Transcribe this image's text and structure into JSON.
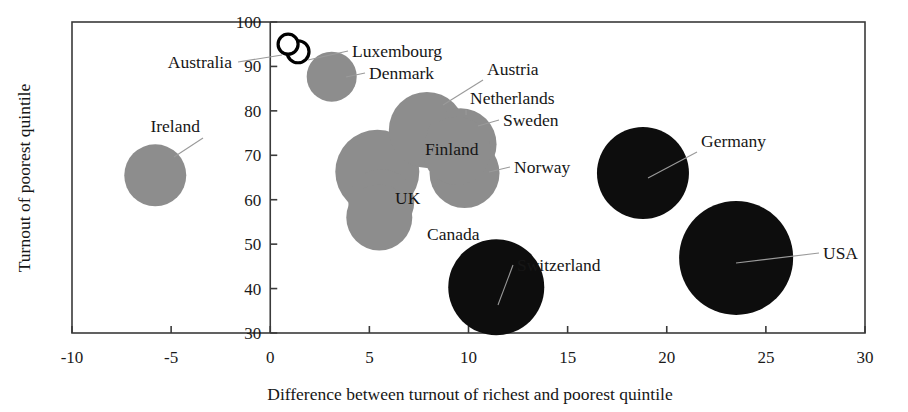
{
  "chart_data": {
    "type": "scatter",
    "title": "",
    "xlabel": "Difference between turnout of richest and poorest quintile",
    "ylabel": "Turnout of poorest quintile",
    "xlim": [
      -10,
      30
    ],
    "ylim": [
      30,
      100
    ],
    "xticks": [
      -10,
      -5,
      0,
      5,
      10,
      15,
      20,
      25,
      30
    ],
    "yticks": [
      30,
      40,
      50,
      60,
      70,
      80,
      90,
      100
    ],
    "xticklabels": [
      "-10",
      "-5",
      "0",
      "5",
      "10",
      "15",
      "20",
      "25",
      "30"
    ],
    "yticklabels": [
      "30",
      "40",
      "50",
      "60",
      "70",
      "80",
      "90",
      "100"
    ],
    "grid": false,
    "legend": false,
    "size_encodes": "bubble area",
    "marker_styles": {
      "grey": "filled grey disc",
      "black": "filled black disc",
      "open": "white disc with black outline"
    },
    "points": [
      {
        "label": "Ireland",
        "x": -5.8,
        "y": 65.5,
        "r_px": 31,
        "style": "grey",
        "label_x": 200,
        "label_y": 132,
        "label_anchor": "end",
        "leader": [
          203,
          138,
          174,
          157
        ]
      },
      {
        "label": "Australia",
        "x": 0.9,
        "y": 95.0,
        "r_px": 10,
        "style": "open",
        "label_x": 232,
        "label_y": 68,
        "label_anchor": "end",
        "leader": [
          238,
          62,
          282,
          55
        ]
      },
      {
        "label": "Luxembourg",
        "x": 1.4,
        "y": 93.3,
        "r_px": 11,
        "style": "open",
        "label_x": 352,
        "label_y": 57,
        "label_anchor": "start",
        "leader": [
          348,
          51,
          308,
          60
        ]
      },
      {
        "label": "Denmark",
        "x": 3.1,
        "y": 87.7,
        "r_px": 25,
        "style": "grey",
        "label_x": 369,
        "label_y": 79,
        "label_anchor": "start",
        "leader": [
          365,
          73,
          346,
          77
        ]
      },
      {
        "label": "Austria",
        "x": 7.9,
        "y": 75.7,
        "r_px": 38,
        "style": "grey",
        "label_x": 487,
        "label_y": 75,
        "label_anchor": "start",
        "leader": [
          483,
          80,
          443,
          105
        ]
      },
      {
        "label": "Netherlands",
        "x": 9.6,
        "y": 72.5,
        "r_px": 36,
        "style": "grey",
        "label_x": 470,
        "label_y": 104,
        "label_anchor": "start",
        "leader": [
          466,
          110,
          466,
          115
        ]
      },
      {
        "label": "Sweden",
        "x": 9.4,
        "y": 71.0,
        "r_px": 34,
        "style": "grey",
        "label_x": 503,
        "label_y": 126,
        "label_anchor": "start",
        "leader": [
          499,
          120,
          478,
          126
        ]
      },
      {
        "label": "Finland",
        "x": 5.4,
        "y": 66.3,
        "r_px": 42,
        "style": "grey",
        "label_x": 425,
        "label_y": 155,
        "label_anchor": "start",
        "leader": [
          null,
          null,
          null,
          null
        ]
      },
      {
        "label": "Norway",
        "x": 9.8,
        "y": 66.0,
        "r_px": 35,
        "style": "grey",
        "label_x": 514,
        "label_y": 173,
        "label_anchor": "start",
        "leader": [
          510,
          167,
          489,
          172
        ]
      },
      {
        "label": "UK",
        "x": 5.6,
        "y": 59.5,
        "r_px": 33,
        "style": "grey",
        "label_x": 395,
        "label_y": 204,
        "label_anchor": "start",
        "leader": [
          null,
          null,
          null,
          null
        ]
      },
      {
        "label": "Canada",
        "x": 5.5,
        "y": 56.0,
        "r_px": 33,
        "style": "grey",
        "label_x": 427,
        "label_y": 240,
        "label_anchor": "start",
        "leader": [
          null,
          null,
          null,
          null
        ]
      },
      {
        "label": "Germany",
        "x": 18.8,
        "y": 66.0,
        "r_px": 46,
        "style": "black",
        "label_x": 701,
        "label_y": 147,
        "label_anchor": "start",
        "leader": [
          697,
          152,
          648,
          178
        ]
      },
      {
        "label": "Switzerland",
        "x": 11.4,
        "y": 40.3,
        "r_px": 48,
        "style": "black",
        "label_x": 517,
        "label_y": 271,
        "label_anchor": "start",
        "leader": [
          513,
          265,
          498,
          305
        ]
      },
      {
        "label": "USA",
        "x": 23.5,
        "y": 46.9,
        "r_px": 57,
        "style": "black",
        "label_x": 823,
        "label_y": 259,
        "label_anchor": "start",
        "leader": [
          819,
          253,
          736,
          263
        ]
      }
    ]
  },
  "axes": {
    "x_title": "Difference between turnout of richest and poorest quintile",
    "y_title": "Turnout of poorest quintile"
  }
}
